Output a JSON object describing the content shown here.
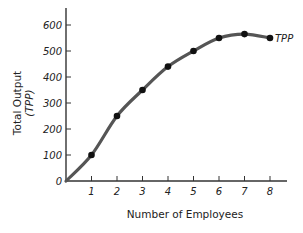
{
  "chart_data": {
    "type": "line",
    "title": "",
    "xlabel": "Number of Employees",
    "ylabel": "Total Output",
    "ylabel_sub": "(TPP)",
    "x": [
      0,
      1,
      2,
      3,
      4,
      5,
      6,
      7,
      8
    ],
    "series": [
      {
        "name": "TPP",
        "values": [
          0,
          100,
          250,
          350,
          440,
          500,
          550,
          565,
          550
        ],
        "markers_at": [
          1,
          2,
          3,
          4,
          5,
          6,
          7,
          8
        ]
      }
    ],
    "x_ticks": [
      "1",
      "2",
      "3",
      "4",
      "5",
      "6",
      "7",
      "8"
    ],
    "y_ticks": [
      "0",
      "100",
      "200",
      "300",
      "400",
      "500",
      "600"
    ],
    "xlim": [
      0,
      8.3
    ],
    "ylim": [
      0,
      650
    ],
    "grid": false,
    "legend": "inline label at end of curve",
    "colors": {
      "line": "#555555",
      "marker": "#111111",
      "axis": "#333333"
    }
  }
}
